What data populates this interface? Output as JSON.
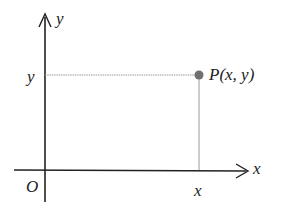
{
  "diagram": {
    "type": "cartesian-point",
    "origin_label": "O",
    "x_axis_label": "x",
    "y_axis_label": "y",
    "x_coord_label": "x",
    "y_coord_label": "y",
    "point_label": "P(x, y)",
    "colors": {
      "axis": "#222222",
      "guide": "#9a9a9a",
      "point": "#707070"
    }
  }
}
